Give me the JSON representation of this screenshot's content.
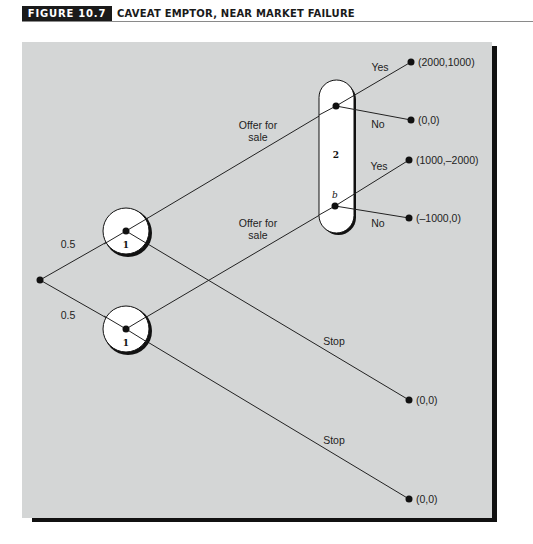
{
  "header": {
    "figure_number": "FIGURE 10.7",
    "title": "CAVEAT EMPTOR, NEAR MARKET FAILURE"
  },
  "diagram": {
    "type": "game-tree",
    "chance_probabilities": [
      "0.5",
      "0.5"
    ],
    "player1_label": "1",
    "player2_label": "2",
    "info_set_node_label": "b",
    "moves": {
      "offer": "Offer for",
      "offer_line2": "sale",
      "stop": "Stop",
      "yes": "Yes",
      "no": "No"
    },
    "payoffs": {
      "upper_yes": "(2000,1000)",
      "upper_no": "(0,0)",
      "lower_yes": "(1000,–2000)",
      "lower_no": "(–1000,0)",
      "upper_stop": "(0,0)",
      "lower_stop": "(0,0)"
    }
  }
}
